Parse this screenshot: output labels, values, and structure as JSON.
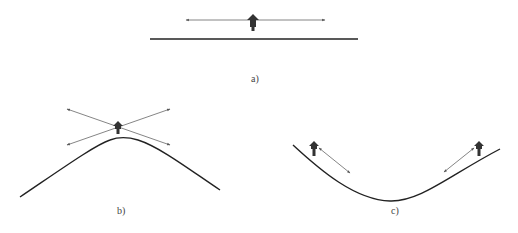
{
  "figure": {
    "panels": [
      {
        "id": "a",
        "label": "a)",
        "surface": "flat line",
        "description": "Particle on flat surface with horizontal double-headed arrow"
      },
      {
        "id": "b",
        "label": "b)",
        "surface": "convex curve (hill)",
        "description": "Particle above convex peak with two crossing double-headed arrows"
      },
      {
        "id": "c",
        "label": "c)",
        "surface": "concave curve (valley)",
        "description": "Two particles on valley slopes with arrows pointing toward valley bottom"
      }
    ]
  },
  "colors": {
    "line": "#222222",
    "arrow": "#555555",
    "particle": "#333333",
    "label": "#444444",
    "background": "#ffffff"
  }
}
